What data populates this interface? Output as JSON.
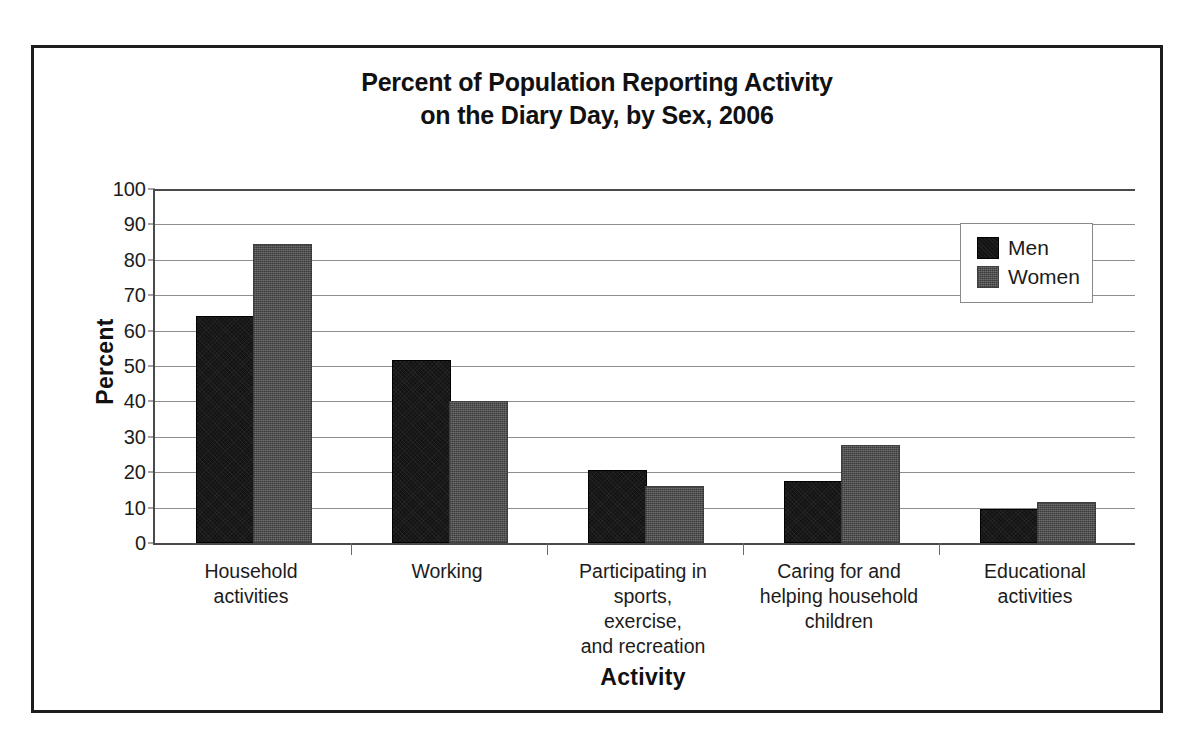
{
  "chart_data": {
    "type": "bar",
    "title": "Percent of Population Reporting Activity on the Diary Day, by Sex, 2006",
    "title_lines": [
      "Percent of Population Reporting Activity",
      "on the Diary Day, by Sex, 2006"
    ],
    "xlabel": "Activity",
    "ylabel": "Percent",
    "ylim": [
      0,
      100
    ],
    "ytick_step": 10,
    "yticks": [
      100,
      90,
      80,
      70,
      60,
      50,
      40,
      30,
      20,
      10,
      0
    ],
    "grid": true,
    "legend_position": "top-right",
    "categories": [
      "Household activities",
      "Working",
      "Participating in sports, exercise, and recreation",
      "Caring for and helping household children",
      "Educational activities"
    ],
    "category_label_lines": [
      [
        "Household",
        "activities"
      ],
      [
        "Working"
      ],
      [
        "Participating in",
        "sports,",
        "exercise,",
        "and recreation"
      ],
      [
        "Caring for and",
        "helping household",
        "children"
      ],
      [
        "Educational",
        "activities"
      ]
    ],
    "series": [
      {
        "name": "Men",
        "color": "#141414",
        "values": [
          63.5,
          51.0,
          20.0,
          17.0,
          9.0
        ]
      },
      {
        "name": "Women",
        "color": "#6f6f6f",
        "values": [
          84.0,
          39.5,
          15.5,
          27.0,
          11.0
        ]
      }
    ]
  },
  "legend": {
    "entries": [
      {
        "label": "Men"
      },
      {
        "label": "Women"
      }
    ]
  }
}
